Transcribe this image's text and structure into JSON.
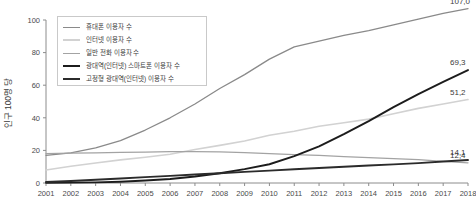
{
  "chart_data": {
    "type": "line",
    "title": "",
    "xlabel": "",
    "ylabel": "인구 100명 당",
    "xlim": [
      2001,
      2018
    ],
    "ylim": [
      0,
      100
    ],
    "yticks": [
      "0",
      "20",
      "40",
      "60",
      "80",
      "100"
    ],
    "grid": false,
    "legend_position": "top-left",
    "categories": [
      "2001",
      "2002",
      "2003",
      "2004",
      "2005",
      "2006",
      "2007",
      "2008",
      "2009",
      "2010",
      "2011",
      "2012",
      "2013",
      "2014",
      "2015",
      "2016",
      "2017",
      "2018"
    ],
    "series": [
      {
        "name": "휴대폰 이용자 수",
        "color": "#8a8a8a",
        "width": 1.3,
        "end_label": "107,0",
        "values": [
          17.0,
          18.5,
          21.5,
          26.0,
          32.5,
          40.0,
          48.5,
          58.0,
          66.5,
          76.0,
          83.5,
          87.0,
          90.5,
          93.5,
          97.0,
          100.5,
          104.0,
          107.0
        ]
      },
      {
        "name": "인터넷 이용자 수",
        "color": "#d2d2d2",
        "width": 1.6,
        "end_label": "51,2",
        "values": [
          8.0,
          10.3,
          12.3,
          14.2,
          15.8,
          17.6,
          20.6,
          23.1,
          25.8,
          29.3,
          31.8,
          34.8,
          37.0,
          39.2,
          42.5,
          45.8,
          48.5,
          51.2
        ]
      },
      {
        "name": "일반 전화 이용자 수",
        "color": "#a3a3a3",
        "width": 1.3,
        "end_label": "12,4",
        "values": [
          18.0,
          18.3,
          18.5,
          18.8,
          19.0,
          19.2,
          19.3,
          19.1,
          18.6,
          18.0,
          17.4,
          16.9,
          16.2,
          15.6,
          15.0,
          14.3,
          13.3,
          12.4
        ]
      },
      {
        "name": "광대역(인터넷) 스마트폰 이용자 수",
        "color": "#1c1c1c",
        "width": 1.9,
        "end_label": "69,3",
        "values": [
          0.1,
          0.2,
          0.4,
          0.8,
          1.5,
          2.5,
          4.0,
          6.0,
          8.5,
          11.5,
          16.5,
          22.5,
          30.0,
          38.0,
          46.5,
          54.5,
          62.0,
          69.3
        ]
      },
      {
        "name": "고정형 광대역(인터넷) 이용자 수",
        "color": "#2b2b2b",
        "width": 1.9,
        "end_label": "14,1",
        "values": [
          0.6,
          1.2,
          2.0,
          2.8,
          3.6,
          4.4,
          5.2,
          6.0,
          6.8,
          7.6,
          8.4,
          9.2,
          10.0,
          10.7,
          11.4,
          12.2,
          13.2,
          14.1
        ]
      }
    ]
  }
}
